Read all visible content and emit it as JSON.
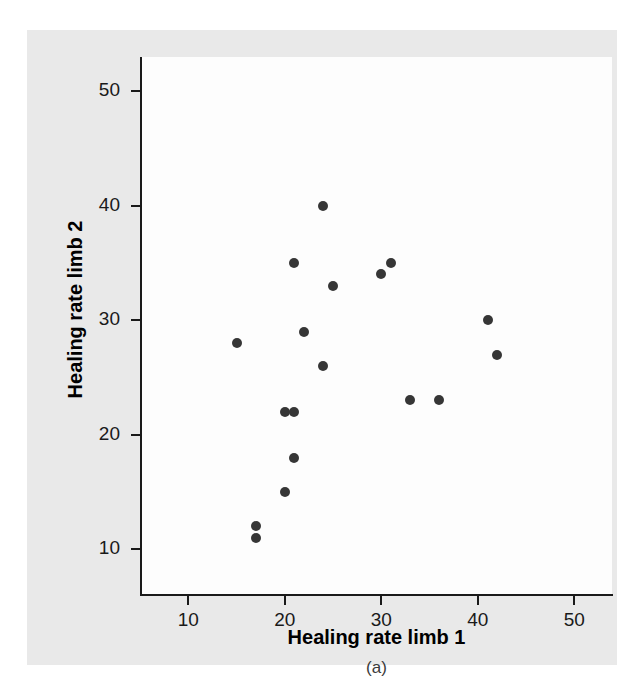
{
  "chart_data": {
    "type": "scatter",
    "title": "",
    "subcaption": "(a)",
    "xlabel": "Healing rate limb 1",
    "ylabel": "Healing rate limb 2",
    "xlim": [
      5,
      54
    ],
    "ylim": [
      6,
      53
    ],
    "xticks": [
      10,
      20,
      30,
      40,
      50
    ],
    "yticks": [
      10,
      20,
      30,
      40,
      50
    ],
    "grid": false,
    "legend": null,
    "marker": {
      "shape": "circle",
      "color": "#363636",
      "size_px": 10
    },
    "points": [
      {
        "x": 15,
        "y": 28
      },
      {
        "x": 17,
        "y": 12
      },
      {
        "x": 17,
        "y": 11
      },
      {
        "x": 20,
        "y": 15
      },
      {
        "x": 20,
        "y": 22
      },
      {
        "x": 21,
        "y": 22
      },
      {
        "x": 21,
        "y": 18
      },
      {
        "x": 21,
        "y": 35
      },
      {
        "x": 22,
        "y": 29
      },
      {
        "x": 24,
        "y": 40
      },
      {
        "x": 24,
        "y": 26
      },
      {
        "x": 25,
        "y": 33
      },
      {
        "x": 30,
        "y": 34
      },
      {
        "x": 31,
        "y": 35
      },
      {
        "x": 33,
        "y": 23
      },
      {
        "x": 36,
        "y": 23
      },
      {
        "x": 41,
        "y": 30
      },
      {
        "x": 42,
        "y": 27
      }
    ]
  },
  "colors": {
    "figure_background": "#e9e9e9",
    "plot_background": "#fdfdfd",
    "axis": "#1a1a1a",
    "marker": "#363636",
    "page_background": "#ffffff"
  }
}
